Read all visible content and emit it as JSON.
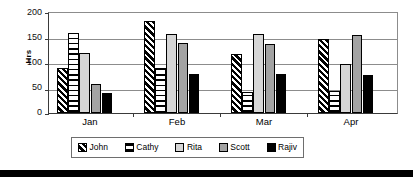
{
  "chart_data": {
    "type": "bar",
    "title": "",
    "xlabel": "",
    "ylabel": "Hrs",
    "categories": [
      "Jan",
      "Feb",
      "Mar",
      "Apr"
    ],
    "series": [
      {
        "name": "John",
        "values": [
          90,
          184,
          118,
          147
        ],
        "swatch": "diagonal-stripes",
        "color": "#000000"
      },
      {
        "name": "Cathy",
        "values": [
          160,
          89,
          41,
          43
        ],
        "swatch": "horizontal-dashes",
        "color": "#ffffff"
      },
      {
        "name": "Rita",
        "values": [
          120,
          158,
          157,
          97
        ],
        "swatch": "solid",
        "color": "#d6d6d6"
      },
      {
        "name": "Scott",
        "values": [
          58,
          139,
          137,
          156
        ],
        "swatch": "solid",
        "color": "#a3a3a3"
      },
      {
        "name": "Rajiv",
        "values": [
          40,
          78,
          77,
          76
        ],
        "swatch": "solid",
        "color": "#000000"
      }
    ],
    "ylim": [
      0,
      200
    ],
    "yticks": [
      0,
      50,
      100,
      150,
      200
    ],
    "ytick_labels": [
      "0",
      "50",
      "100",
      "150",
      "200"
    ],
    "grid": true,
    "grid_axis": "y",
    "legend_position": "bottom",
    "axis_color": "#3a3a3a",
    "grid_color": "#8c8c8c"
  },
  "legend": {
    "entries": [
      {
        "label": "John"
      },
      {
        "label": "Cathy"
      },
      {
        "label": "Rita"
      },
      {
        "label": "Scott"
      },
      {
        "label": "Rajiv"
      }
    ]
  }
}
